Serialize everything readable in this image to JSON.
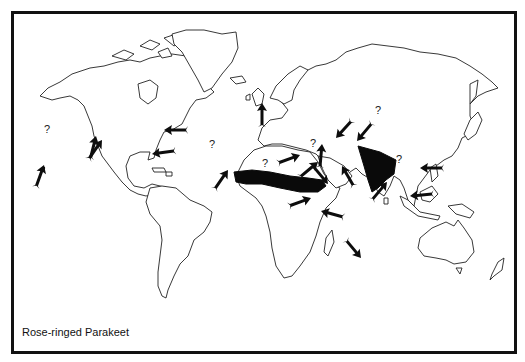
{
  "figure": {
    "caption": "Rose-ringed Parakeet",
    "frame_color": "#111111",
    "range_color": "#0a0a0a",
    "arrow_color": "#0d0d0d"
  },
  "map": {
    "projection": "world outline",
    "native_ranges": [
      {
        "name": "sub-saharan-africa-band",
        "label": "Sahel belt range"
      },
      {
        "name": "indian-subcontinent",
        "label": "India range"
      }
    ],
    "introductions": [
      {
        "id": "hawaii",
        "question": true
      },
      {
        "id": "california-north",
        "question": false
      },
      {
        "id": "california-south",
        "question": false
      },
      {
        "id": "northeast-usa",
        "question": false
      },
      {
        "id": "florida",
        "question": false
      },
      {
        "id": "england",
        "question": false
      },
      {
        "id": "west-africa-coast",
        "question": true
      },
      {
        "id": "turkey",
        "question": false
      },
      {
        "id": "caspian",
        "question": false
      },
      {
        "id": "central-asia",
        "question": true
      },
      {
        "id": "libya",
        "question": true
      },
      {
        "id": "egypt",
        "question": false
      },
      {
        "id": "arabia",
        "question": false
      },
      {
        "id": "horn-of-africa",
        "question": false
      },
      {
        "id": "east-africa",
        "question": false
      },
      {
        "id": "zanzibar",
        "question": false
      },
      {
        "id": "mauritius",
        "question": false
      },
      {
        "id": "sri-lanka-south-india",
        "question": false
      },
      {
        "id": "hong-kong",
        "question": false
      },
      {
        "id": "singapore",
        "question": false
      },
      {
        "id": "burma",
        "question": true
      }
    ],
    "question_mark": "?"
  }
}
